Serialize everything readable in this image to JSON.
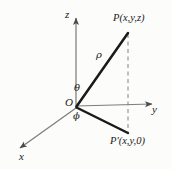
{
  "figure": {
    "background_color": "#fcfcfb",
    "ink_color": "#1a1a1a",
    "axis_color": "#7d7d7d"
  },
  "axes": {
    "z_label": "z",
    "y_label": "y",
    "x_label": "x",
    "origin_label": "O"
  },
  "labels": {
    "rho": "ρ",
    "theta": "θ",
    "phi": "ϕ"
  },
  "points": {
    "p_label": "P(x,y,z)",
    "p_prime_label": "P′(x,y,0)"
  },
  "geometry": {
    "origin": {
      "x": 76,
      "y": 107
    },
    "z_axis_tip": {
      "x": 76,
      "y": 14
    },
    "y_axis_tip": {
      "x": 158,
      "y": 104
    },
    "x_axis_tip": {
      "x": 14,
      "y": 152
    },
    "point_p": {
      "x": 128,
      "y": 33
    },
    "point_p_prime": {
      "x": 128,
      "y": 133
    }
  }
}
